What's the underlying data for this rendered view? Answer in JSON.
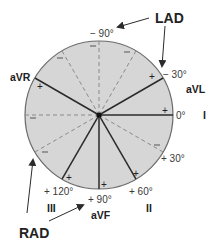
{
  "diagram": {
    "colors": {
      "circle_fill": "#d6d6d6",
      "circle_stroke": "#6a6a6a",
      "axis_line": "#2b2b2b",
      "dashed_line": "#8a8a8a",
      "text": "#2a2a2a"
    },
    "circle": {
      "cx": 99,
      "cy": 115,
      "r": 74
    },
    "leads": [
      {
        "name": "I",
        "angle": 0,
        "degree_label": "0°",
        "deg_x": 176,
        "deg_y": 111,
        "lead_x": 203,
        "lead_y": 110
      },
      {
        "name": "aVL",
        "angle": -30,
        "degree_label": "− 30°",
        "deg_x": 163,
        "deg_y": 70,
        "lead_x": 186,
        "lead_y": 84
      },
      {
        "name": "aVR",
        "angle": -150,
        "degree_label": "",
        "deg_x": 0,
        "deg_y": 0,
        "lead_x": 10,
        "lead_y": 72
      },
      {
        "name": "II",
        "angle": 60,
        "degree_label": "+ 60°",
        "deg_x": 129,
        "deg_y": 187,
        "lead_x": 146,
        "lead_y": 203
      },
      {
        "name": "aVF",
        "angle": 90,
        "degree_label": "+ 90°",
        "deg_x": 88,
        "deg_y": 195,
        "lead_x": 91,
        "lead_y": 210
      },
      {
        "name": "III",
        "angle": 120,
        "degree_label": "+ 120°",
        "deg_x": 44,
        "deg_y": 187,
        "lead_x": 47,
        "lead_y": 203
      }
    ],
    "extra_degree_labels": [
      {
        "text": "− 90°",
        "x": 90,
        "y": 29
      },
      {
        "text": "+ 30°",
        "x": 161,
        "y": 154
      }
    ],
    "annotations": [
      {
        "text": "LAD",
        "x": 155,
        "y": 11
      },
      {
        "text": "RAD",
        "x": 19,
        "y": 226
      }
    ],
    "pos_marks": [
      {
        "x": 165,
        "y": 111
      },
      {
        "x": 152,
        "y": 77
      },
      {
        "x": 40,
        "y": 87
      },
      {
        "x": 136,
        "y": 174
      },
      {
        "x": 104,
        "y": 185
      },
      {
        "x": 69,
        "y": 178
      }
    ],
    "neg_marks": [
      {
        "x": 93,
        "y": 46
      },
      {
        "x": 127,
        "y": 52
      },
      {
        "x": 60,
        "y": 58
      },
      {
        "x": 33,
        "y": 118
      },
      {
        "x": 45,
        "y": 152
      },
      {
        "x": 157,
        "y": 145
      }
    ]
  }
}
